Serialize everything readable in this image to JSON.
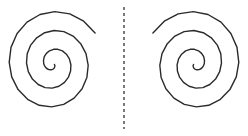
{
  "figure": {
    "width": 248,
    "height": 136,
    "background": "#ffffff",
    "stroke_color": "#2a2a2a"
  },
  "symmetry_axis": {
    "x": 124,
    "y_start": 7,
    "y_end": 129,
    "style": "dashed",
    "color": "#333333"
  },
  "spirals": [
    {
      "id": "left",
      "center": [
        53,
        64
      ],
      "turns": 2.85,
      "start_angle_deg": 20,
      "growth_x": 2.75,
      "growth_y": 3.0,
      "direction": "clockwise-outward",
      "mirror": false
    },
    {
      "id": "right",
      "center": [
        195,
        64
      ],
      "turns": 2.85,
      "start_angle_deg": 20,
      "growth_x": 2.75,
      "growth_y": 3.0,
      "direction": "counterclockwise-outward",
      "mirror": true
    }
  ]
}
